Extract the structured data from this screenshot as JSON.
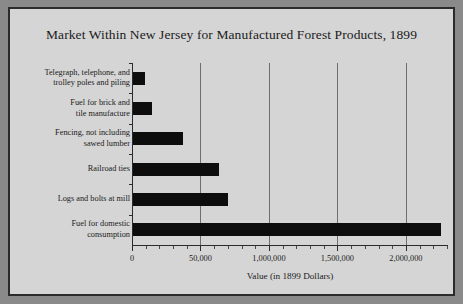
{
  "figure": {
    "background_color": "#d5d5d5",
    "border_color": "#2b2b2b",
    "bar_color": "#0d0d0d",
    "gridline_color": "#6e6e6e"
  },
  "chart_data": {
    "type": "bar",
    "orientation": "horizontal",
    "title": "Market Within New Jersey for Manufactured Forest Products, 1899",
    "xlabel": "Value (in 1899 Dollars)",
    "ylabel": "",
    "categories": [
      "Telegraph, telephone, and trolley poles and piling",
      "Fuel for brick and tile manufacture",
      "Fencing, not including sawed lumber",
      "Railroad ties",
      "Logs and bolts at mill",
      "Fuel for domestic consumption"
    ],
    "values": [
      90000,
      140000,
      365000,
      625000,
      690000,
      2250000
    ],
    "xlim": [
      0,
      2300000
    ],
    "xticks": [
      0,
      500000,
      1000000,
      1500000,
      2000000
    ],
    "xtick_labels": [
      "0",
      "50,000",
      "1,000,000",
      "1,500,000",
      "2,000,000"
    ],
    "minor_tick_interval": 100000,
    "grid": "vertical-major-only",
    "legend": "none"
  },
  "category_label_lines": [
    [
      "Telegraph, telephone, and",
      "trolley poles and piling"
    ],
    [
      "Fuel for brick and",
      "tile manufacture"
    ],
    [
      "Fencing, not including",
      "sawed lumber"
    ],
    [
      "Railroad ties"
    ],
    [
      "Logs and bolts at mill"
    ],
    [
      "Fuel for domestic",
      "consumption"
    ]
  ]
}
